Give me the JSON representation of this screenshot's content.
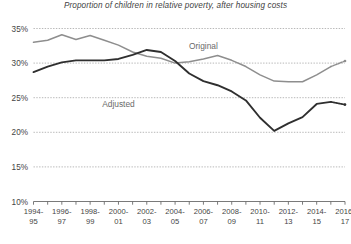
{
  "chart_data": {
    "type": "line",
    "title": "Proportion of children in relative poverty, after housing costs",
    "xlabel": "",
    "ylabel": "",
    "ylim": [
      10,
      35
    ],
    "ytick_labels": [
      "35%",
      "30%",
      "25%",
      "20%",
      "15%",
      "10%"
    ],
    "ytick_values": [
      35,
      30,
      25,
      20,
      15,
      10
    ],
    "grid": true,
    "legend_position": "inline-labels",
    "categories": [
      "1994-95",
      "1995-96",
      "1996-97",
      "1997-98",
      "1998-99",
      "1999-00",
      "2000-01",
      "2001-02",
      "2002-03",
      "2003-04",
      "2004-05",
      "2005-06",
      "2006-07",
      "2007-08",
      "2008-09",
      "2009-10",
      "2010-11",
      "2011-12",
      "2012-13",
      "2013-14",
      "2014-15",
      "2015-16",
      "2016-17"
    ],
    "xtick_labels_shown": [
      "1994-95",
      "1996-97",
      "1998-99",
      "2000-01",
      "2002-03",
      "2004-05",
      "2006-07",
      "2008-09",
      "2010-11",
      "2012-13",
      "2014-15",
      "2016-17"
    ],
    "series": [
      {
        "name": "Original",
        "color": "#8e8e8e",
        "label_text": "Original",
        "values": [
          33.0,
          33.3,
          34.1,
          33.4,
          34.0,
          33.3,
          32.6,
          31.6,
          31.0,
          30.7,
          30.0,
          30.2,
          30.6,
          31.1,
          30.4,
          29.5,
          28.3,
          27.4,
          27.3,
          27.3,
          28.3,
          29.5,
          30.3
        ],
        "projected_from_index": 21
      },
      {
        "name": "Adjusted",
        "color": "#2f2f2f",
        "label_text": "Adjusted",
        "values": [
          28.7,
          29.5,
          30.1,
          30.4,
          30.4,
          30.4,
          30.6,
          31.2,
          31.9,
          31.6,
          30.3,
          28.5,
          27.4,
          26.8,
          25.9,
          24.6,
          22.1,
          20.2,
          21.3,
          22.2,
          24.1,
          24.4,
          24.0
        ],
        "projected_from_index": 21
      }
    ],
    "annotations": [
      {
        "text": "Original",
        "x_category": "2006-07",
        "y_value": 32.0
      },
      {
        "text": "Adjusted",
        "x_category": "2000-01",
        "y_value": 23.6
      }
    ]
  }
}
